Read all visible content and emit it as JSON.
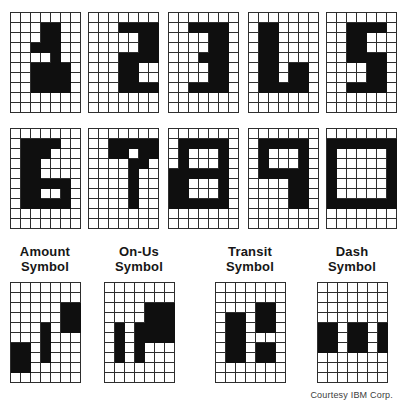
{
  "figure": {
    "courtesy": "Courtesy IBM Corp."
  },
  "colors": {
    "background": "#ffffff",
    "grid_line": "#2e2e2e",
    "cell_fill": "#0f0f0f",
    "label_text": "#161616",
    "courtesy_text": "#3c3c3c"
  },
  "grid_spec": {
    "columns": 7,
    "rows": 10,
    "cell_px": 10
  },
  "digits": [
    {
      "char": "1",
      "pattern": [
        ".......",
        "...##..",
        "...##..",
        "..###..",
        "....#..",
        "..####.",
        "..####.",
        "..####.",
        ".......",
        "......."
      ]
    },
    {
      "char": "2",
      "pattern": [
        ".......",
        "...####",
        ".....##",
        ".....##",
        "...####",
        "...##..",
        "...##..",
        "...####",
        ".......",
        "......."
      ]
    },
    {
      "char": "3",
      "pattern": [
        ".......",
        "..####.",
        "....##.",
        "....##.",
        "...###.",
        "....##.",
        "....##.",
        "..####.",
        ".......",
        "......."
      ]
    },
    {
      "char": "4",
      "pattern": [
        ".......",
        ".##....",
        ".##....",
        ".##....",
        ".##....",
        ".##.##.",
        ".##.##.",
        ".#####.",
        ".......",
        "......."
      ]
    },
    {
      "char": "5",
      "pattern": [
        ".......",
        "..####.",
        "..##...",
        "..##...",
        "..####.",
        "....##.",
        "....##.",
        "..####.",
        ".......",
        "......."
      ]
    },
    {
      "char": "6",
      "pattern": [
        ".......",
        ".####..",
        ".###...",
        ".##....",
        ".##....",
        ".#####.",
        ".##..#.",
        ".#####.",
        ".......",
        "......."
      ]
    },
    {
      "char": "7",
      "pattern": [
        ".......",
        "..#####",
        "..##.##",
        "....##.",
        "....#..",
        "....#..",
        "....#..",
        "....#..",
        ".......",
        "......."
      ]
    },
    {
      "char": "8",
      "pattern": [
        ".......",
        ".#####.",
        ".#...#.",
        ".#...#.",
        "######.",
        "##...#.",
        "##...#.",
        "######.",
        ".......",
        "......."
      ]
    },
    {
      "char": "9",
      "pattern": [
        ".......",
        ".#####.",
        ".#...#.",
        ".#...#.",
        ".#####.",
        "....##.",
        "....##.",
        "....##.",
        ".......",
        "......."
      ]
    },
    {
      "char": "0",
      "pattern": [
        ".......",
        "#######",
        "#.....#",
        "#.....#",
        "#.....#",
        "#.....#",
        "#.....#",
        "#######",
        ".......",
        "......."
      ]
    }
  ],
  "symbols": [
    {
      "name": "amount",
      "label_line1": "Amount",
      "label_line2": "Symbol",
      "pattern": [
        ".......",
        ".......",
        ".....##",
        ".....##",
        "...#.##",
        "...#...",
        "##.#...",
        "##.#...",
        "##.....",
        "......."
      ]
    },
    {
      "name": "on-us",
      "label_line1": "On-Us",
      "label_line2": "Symbol",
      "pattern": [
        ".......",
        ".......",
        "....###",
        "....###",
        ".#.####",
        ".#.####",
        ".#.#...",
        ".#.#...",
        ".......",
        "......."
      ]
    },
    {
      "name": "transit",
      "label_line1": "Transit",
      "label_line2": "Symbol",
      "pattern": [
        ".......",
        ".......",
        "....##.",
        ".##.##.",
        ".##.##.",
        ".##....",
        ".##.##.",
        ".##.##.",
        ".......",
        "......."
      ]
    },
    {
      "name": "dash",
      "label_line1": "Dash",
      "label_line2": "Symbol",
      "pattern": [
        ".......",
        ".......",
        ".......",
        ".......",
        "##.##.#",
        "##.##.#",
        "##.##.#",
        ".......",
        ".......",
        "......."
      ]
    }
  ]
}
